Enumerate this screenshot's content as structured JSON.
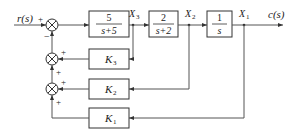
{
  "diagram": {
    "type": "block-diagram",
    "input": {
      "label": "r(s)"
    },
    "output": {
      "label": "c(s)"
    },
    "blocks": [
      {
        "id": "G1",
        "num": "5",
        "den": "s+5",
        "output_signal": "X3"
      },
      {
        "id": "G2",
        "num": "2",
        "den": "s+2",
        "output_signal": "X2"
      },
      {
        "id": "G3",
        "num": "1",
        "den": "s",
        "output_signal": "X1"
      }
    ],
    "feedback_blocks": [
      {
        "id": "K3",
        "label_main": "K",
        "label_sub": "3",
        "from": "X3"
      },
      {
        "id": "K2",
        "label_main": "K",
        "label_sub": "2",
        "from": "X2"
      },
      {
        "id": "K1",
        "label_main": "K",
        "label_sub": "1",
        "from": "X1"
      }
    ],
    "signals": [
      {
        "main": "X",
        "sub": "3"
      },
      {
        "main": "X",
        "sub": "2"
      },
      {
        "main": "X",
        "sub": "1"
      }
    ],
    "summing_junctions": [
      {
        "id": "S1",
        "signs": {
          "left": "+",
          "bottom": "−"
        }
      },
      {
        "id": "S2",
        "signs": {
          "right": "+",
          "bottom": "+"
        }
      },
      {
        "id": "S3",
        "signs": {
          "right": "+",
          "bottom": "+"
        }
      }
    ]
  }
}
